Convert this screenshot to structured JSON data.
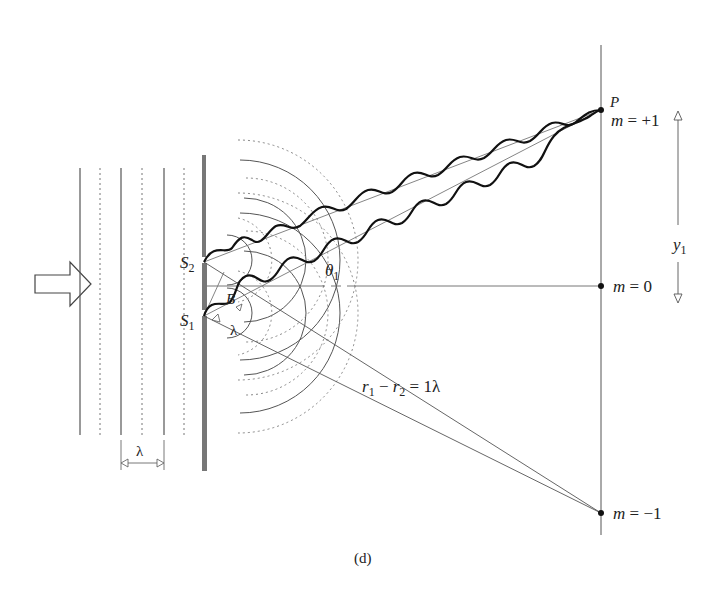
{
  "figure": {
    "caption": "(d)",
    "colors": {
      "ink": "#222222",
      "thin_line": "#555555",
      "dotted": "#777777",
      "barrier": "#666666"
    },
    "incident": {
      "arrow_icon": "right-arrow-outline",
      "wavefront_spacing_label": "λ"
    },
    "slits": {
      "s2_label": "S",
      "s2_sub": "2",
      "s1_label": "S",
      "s1_sub": "1",
      "b_label": "B",
      "lambda_label": "λ"
    },
    "angle": {
      "theta": "θ",
      "theta_sub": "1"
    },
    "path_difference": {
      "r1": "r",
      "r1_sub": "1",
      "minus": " − ",
      "r2": "r",
      "r2_sub": "2",
      "equals": " = 1λ"
    },
    "screen": {
      "point_label": "P",
      "orders": [
        {
          "m": "m",
          "eq": " = ",
          "value": "+1"
        },
        {
          "m": "m",
          "eq": " = ",
          "value": "0"
        },
        {
          "m": "m",
          "eq": " = ",
          "value": "−1"
        }
      ],
      "y_label": "y",
      "y_sub": "1"
    }
  }
}
